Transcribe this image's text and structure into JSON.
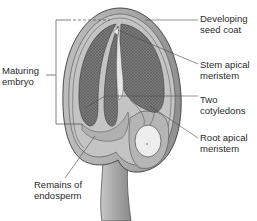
{
  "diagram": {
    "type": "seed-anatomy",
    "labels": [
      {
        "id": "seed-coat",
        "lines": [
          "Developing",
          "seed coat"
        ],
        "side": "right"
      },
      {
        "id": "stem-apical-meristem",
        "lines": [
          "Stem apical",
          "meristem"
        ],
        "side": "right"
      },
      {
        "id": "cotyledons",
        "lines": [
          "Two",
          "cotyledons"
        ],
        "side": "right"
      },
      {
        "id": "root-apical-meristem",
        "lines": [
          "Root apical",
          "meristem"
        ],
        "side": "right"
      },
      {
        "id": "maturing-embryo",
        "lines": [
          "Maturing",
          "embryo"
        ],
        "side": "left"
      },
      {
        "id": "endosperm",
        "lines": [
          "Remains of",
          "endosperm"
        ],
        "side": "bottom-left"
      }
    ],
    "colors": {
      "background": "#ffffff",
      "seed_coat": "#a9a9a9",
      "seed_inner": "#c4c4c4",
      "cotyledon_fill": "#6e6e6e",
      "highlight": "#e6e6e6",
      "outline": "#3c3c3c",
      "leader_line": "#4a4a4a",
      "text": "#2a2a2a"
    }
  }
}
